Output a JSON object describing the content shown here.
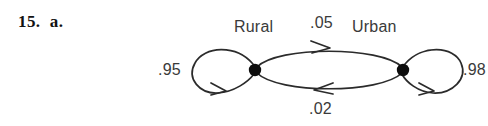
{
  "figure": {
    "problem_label": "15.  a.",
    "type": "state-transition-diagram",
    "background_color": "#ffffff",
    "stroke_color": "#2b2b2b",
    "text_color": "#3a3a3a",
    "nodes": [
      {
        "id": "rural",
        "label": "Rural",
        "x": 255,
        "y": 70
      },
      {
        "id": "urban",
        "label": "Urban",
        "x": 403,
        "y": 70
      }
    ],
    "edges": [
      {
        "id": "rural-self",
        "from": "rural",
        "to": "rural",
        "weight": ".95"
      },
      {
        "id": "rural-urban",
        "from": "rural",
        "to": "urban",
        "weight": ".05"
      },
      {
        "id": "urban-rural",
        "from": "urban",
        "to": "rural",
        "weight": ".02"
      },
      {
        "id": "urban-self",
        "from": "urban",
        "to": "urban",
        "weight": ".98"
      }
    ]
  }
}
